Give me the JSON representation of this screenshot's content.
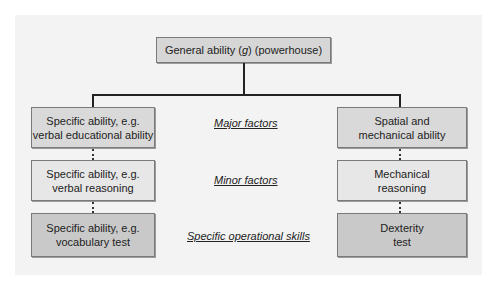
{
  "diagram": {
    "root": {
      "label_prefix": "General ability (",
      "label_g": "g",
      "label_suffix": ") (powerhouse)"
    },
    "left_branch": {
      "major": {
        "line1": "Specific ability, e.g.",
        "line2": "verbal educational ability"
      },
      "minor": {
        "line1": "Specific ability, e.g.",
        "line2": "verbal reasoning"
      },
      "operational": {
        "line1": "Specific ability, e.g.",
        "line2": "vocabulary test"
      }
    },
    "right_branch": {
      "major": {
        "line1": "Spatial and",
        "line2": "mechanical ability"
      },
      "minor": {
        "line1": "Mechanical",
        "line2": "reasoning"
      },
      "operational": {
        "line1": "Dexterity",
        "line2": "test"
      }
    },
    "level_labels": {
      "major": "Major factors",
      "minor": "Minor factors",
      "operational": "Specific operational skills"
    },
    "colors": {
      "panel_bg": "#f3f3f3",
      "major_box": "#d9d9d9",
      "minor_box": "#e7e7e7",
      "operational_box": "#c9c9c9",
      "line": "#222222"
    }
  }
}
